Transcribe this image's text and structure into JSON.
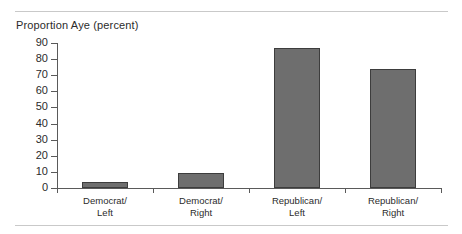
{
  "chart_data": {
    "type": "bar",
    "title": "Proportion Aye (percent)",
    "xlabel": "",
    "ylabel": "Proportion Aye (percent)",
    "categories": [
      "Democrat/\nLeft",
      "Democrat/\nRight",
      "Republican/\nLeft",
      "Republican/\nRight"
    ],
    "category_lines": [
      [
        "Democrat/",
        "Left"
      ],
      [
        "Democrat/",
        "Right"
      ],
      [
        "Republican/",
        "Left"
      ],
      [
        "Republican/",
        "Right"
      ]
    ],
    "values": [
      4,
      9,
      87,
      74
    ],
    "ylim": [
      0,
      90
    ],
    "yticks": [
      0,
      10,
      20,
      30,
      40,
      50,
      60,
      70,
      80,
      90
    ],
    "ytick_labels": [
      "0",
      "10",
      "20",
      "30",
      "40",
      "50",
      "60",
      "70",
      "80",
      "90"
    ],
    "grid": false,
    "legend": null,
    "bar_color": "#6e6e6e",
    "bar_edge_color": "#3d3d3d",
    "axis_color": "#5a5a5a",
    "text_color": "#2b2b2b",
    "rule_color": "#c9c9c9",
    "background": "#ffffff"
  }
}
